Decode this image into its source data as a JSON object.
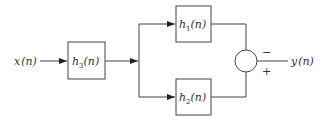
{
  "diagram": {
    "type": "block-diagram",
    "input": {
      "var": "x",
      "arg": "(n)"
    },
    "output": {
      "var": "y",
      "arg": "(n)"
    },
    "blocks": [
      {
        "id": "h3",
        "var": "h",
        "sub": "3",
        "arg": "(n)"
      },
      {
        "id": "h1",
        "var": "h",
        "sub": "1",
        "arg": "(n)"
      },
      {
        "id": "h2",
        "var": "h",
        "sub": "2",
        "arg": "(n)"
      }
    ],
    "summer": {
      "top_sign": "−",
      "bottom_sign": "+"
    },
    "colors": {
      "stroke": "#444444",
      "text": "#333333",
      "background": "#ffffff"
    }
  }
}
